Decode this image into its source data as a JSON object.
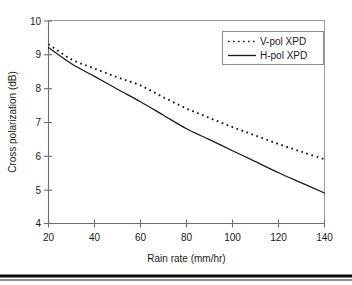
{
  "chart_data": {
    "type": "line",
    "title": "",
    "xlabel": "Rain rate (mm/hr)",
    "ylabel": "Cross polarization (dB)",
    "xlim": [
      20,
      140
    ],
    "ylim": [
      4,
      10
    ],
    "xticks": [
      20,
      40,
      60,
      80,
      100,
      120,
      140
    ],
    "yticks": [
      4,
      5,
      6,
      7,
      8,
      9,
      10
    ],
    "xtick_labels": [
      "20",
      "40",
      "60",
      "80",
      "100",
      "120",
      "140"
    ],
    "ytick_labels": [
      "4",
      "5",
      "6",
      "7",
      "8",
      "9",
      "10"
    ],
    "grid": false,
    "legend_position": "top-right",
    "x": [
      20,
      30,
      40,
      50,
      60,
      70,
      80,
      90,
      100,
      110,
      120,
      130,
      140
    ],
    "series": [
      {
        "name": "V-pol XPD",
        "style": "dotted",
        "color": "#1a1a1a",
        "values": [
          9.3,
          8.85,
          8.58,
          8.32,
          8.08,
          7.73,
          7.4,
          7.12,
          6.85,
          6.6,
          6.35,
          6.12,
          5.9
        ]
      },
      {
        "name": "H-pol XPD",
        "style": "solid",
        "color": "#1a1a1a",
        "values": [
          9.2,
          8.72,
          8.35,
          7.97,
          7.6,
          7.2,
          6.8,
          6.48,
          6.15,
          5.83,
          5.5,
          5.2,
          4.9
        ]
      }
    ]
  },
  "legend": {
    "entries": [
      {
        "label": "V-pol XPD",
        "marker": "dotted-line-swatch"
      },
      {
        "label": "H-pol XPD",
        "marker": "solid-line-swatch"
      }
    ]
  },
  "axes": {
    "x_title": "Rain rate (mm/hr)",
    "y_title": "Cross polarization (dB)"
  },
  "colors": {
    "series": "#1a1a1a",
    "axis": "#6d6d6d",
    "frame": "#9a9a9a",
    "background": "#ffffff",
    "footer_rule": "#0a0a0a"
  }
}
